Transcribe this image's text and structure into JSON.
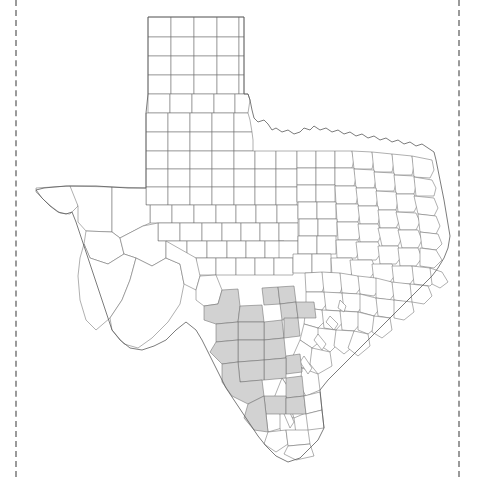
{
  "figure": {
    "kind": "county-distribution-map",
    "region_title": "Texas",
    "background_color": "#ffffff",
    "shaded_fill_color": "#d2d2d2",
    "unshaded_fill_color": "#ffffff",
    "county_border_color": "#6e6e6e",
    "state_border_color": "#5a5a5a",
    "shaded_county_count": 20,
    "total_county_count": 254
  },
  "page_marks": {
    "left_rule_color": "#9a9a9a",
    "right_rule_color": "#9a9a9a",
    "left_rule_x": 15,
    "right_rule_x": 458,
    "style": "dash-dot"
  },
  "shaded_counties": [
    "Val Verde",
    "Edwards",
    "Real",
    "Bandera",
    "Medina",
    "Uvalde",
    "Kinney",
    "Maverick",
    "Zavala",
    "Frio",
    "Atascosa",
    "La Salle",
    "McMullen",
    "Dimmit",
    "Webb",
    "Duval",
    "Zapata",
    "Jim Hogg",
    "Brooks",
    "Bexar"
  ],
  "unshaded_note": "All remaining Texas counties are drawn as white outlines.",
  "map_regions": {
    "panhandle": "rectangular grid counties, northwest Texas",
    "big_bend": "large counties, far west Texas",
    "east_texas": "dense small counties",
    "gulf_coast": "coastline with barrier islands",
    "rio_grande_valley": "southern tip, unshaded"
  }
}
